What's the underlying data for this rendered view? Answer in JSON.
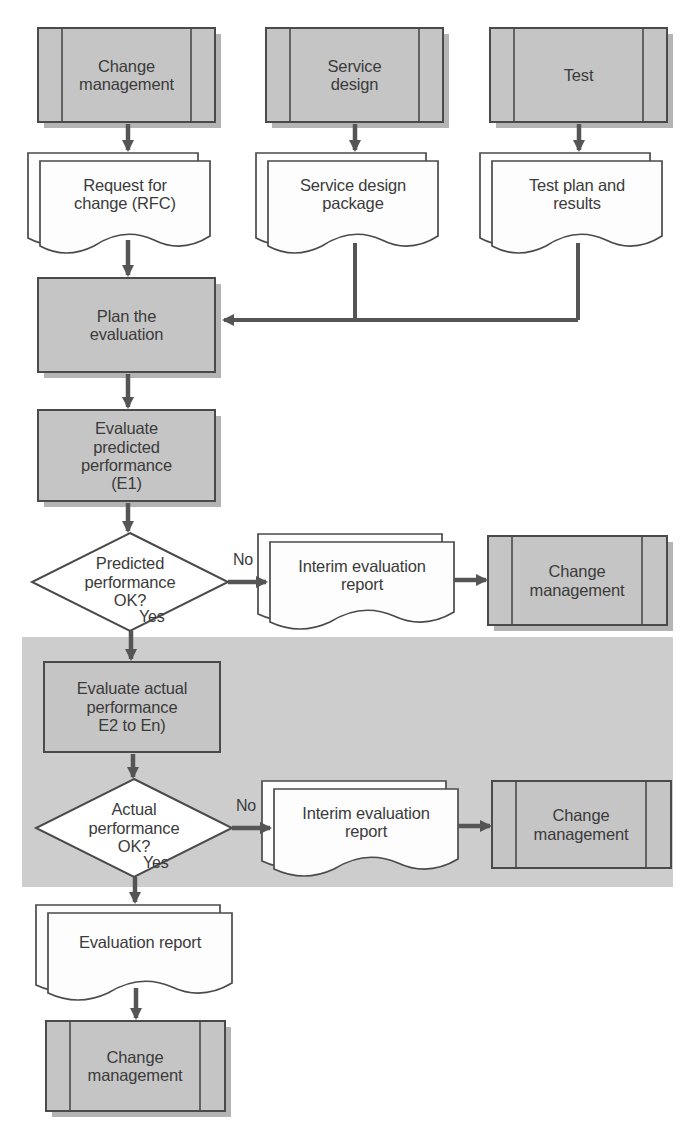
{
  "diagram": {
    "colors": {
      "shape_fill": "#c5c5c5",
      "shape_stroke": "#4a4a4a",
      "doc_fill": "#fdfdfd",
      "band_fill": "#cdcdcd",
      "shadow": "#b4b4b4",
      "text": "#3b3b3b",
      "connector": "#555555"
    },
    "highlight_band": {
      "name": "actual-performance-evaluation-band",
      "x": 22,
      "y": 637,
      "width": 651,
      "height": 250
    },
    "nodes": [
      {
        "id": "change-management-top",
        "type": "predefined-process",
        "label": "Change\nmanagement",
        "x": 38,
        "y": 28,
        "w": 177,
        "h": 94
      },
      {
        "id": "service-design",
        "type": "predefined-process",
        "label": "Service\ndesign",
        "x": 266,
        "y": 28,
        "w": 177,
        "h": 94
      },
      {
        "id": "test",
        "type": "predefined-process",
        "label": "Test",
        "x": 490,
        "y": 28,
        "w": 177,
        "h": 94
      },
      {
        "id": "request-for-change",
        "type": "multi-document",
        "label": "Request for\nchange (RFC)",
        "x": 28,
        "y": 153,
        "w": 182,
        "h": 85
      },
      {
        "id": "service-design-package",
        "type": "multi-document",
        "label": "Service design\npackage",
        "x": 256,
        "y": 153,
        "w": 182,
        "h": 85
      },
      {
        "id": "test-plan-results",
        "type": "multi-document",
        "label": "Test plan and\nresults",
        "x": 480,
        "y": 153,
        "w": 182,
        "h": 85
      },
      {
        "id": "plan-the-evaluation",
        "type": "process",
        "label": "Plan the\nevaluation",
        "x": 38,
        "y": 278,
        "w": 177,
        "h": 94
      },
      {
        "id": "evaluate-predicted",
        "type": "process",
        "label": "Evaluate\npredicted\nperformance\n(E1)",
        "x": 38,
        "y": 410,
        "w": 177,
        "h": 91
      },
      {
        "id": "predicted-ok-decision",
        "type": "decision",
        "label": "Predicted\nperformance\nOK?",
        "x": 32,
        "y": 533,
        "w": 196,
        "h": 98
      },
      {
        "id": "interim-report-1",
        "type": "multi-document",
        "label": "Interim evaluation\nreport",
        "x": 258,
        "y": 534,
        "w": 196,
        "h": 82
      },
      {
        "id": "change-management-1",
        "type": "predefined-process",
        "label": "Change\nmanagement",
        "x": 488,
        "y": 536,
        "w": 179,
        "h": 89
      },
      {
        "id": "evaluate-actual",
        "type": "process",
        "label": "Evaluate actual\nperformance\nE2 to En)",
        "x": 44,
        "y": 662,
        "w": 176,
        "h": 90
      },
      {
        "id": "actual-ok-decision",
        "type": "decision",
        "label": "Actual\nperformance\nOK?",
        "x": 36,
        "y": 779,
        "w": 196,
        "h": 98
      },
      {
        "id": "interim-report-2",
        "type": "multi-document",
        "label": "Interim evaluation\nreport",
        "x": 262,
        "y": 781,
        "w": 196,
        "h": 82
      },
      {
        "id": "change-management-2",
        "type": "predefined-process",
        "label": "Change\nmanagement",
        "x": 492,
        "y": 781,
        "w": 179,
        "h": 87
      },
      {
        "id": "evaluation-report",
        "type": "multi-document",
        "label": "Evaluation report",
        "x": 36,
        "y": 905,
        "w": 196,
        "h": 82
      },
      {
        "id": "change-management-bottom",
        "type": "predefined-process",
        "label": "Change\nmanagement",
        "x": 46,
        "y": 1021,
        "w": 179,
        "h": 90
      }
    ],
    "edge_labels": [
      {
        "id": "no-label-1",
        "text": "No",
        "x": 233,
        "y": 551
      },
      {
        "id": "yes-label-1",
        "text": "Yes",
        "x": 139,
        "y": 608
      },
      {
        "id": "no-label-2",
        "text": "No",
        "x": 236,
        "y": 797
      },
      {
        "id": "yes-label-2",
        "text": "Yes",
        "x": 143,
        "y": 854
      }
    ]
  }
}
